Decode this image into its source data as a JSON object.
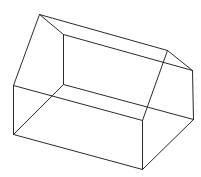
{
  "figure": {
    "stroke_color": "#2a2a2a",
    "background": "#ffffff",
    "vertices": {
      "A": [
        39,
        14
      ],
      "B": [
        63,
        34
      ],
      "C": [
        13,
        85
      ],
      "D": [
        13,
        134
      ],
      "E": [
        63,
        84
      ],
      "F": [
        142,
        120
      ],
      "G": [
        142,
        169
      ],
      "P": [
        167,
        50
      ],
      "Q": [
        192,
        70
      ],
      "R": [
        193,
        119
      ]
    },
    "edges": [
      [
        "A",
        "B"
      ],
      [
        "A",
        "C"
      ],
      [
        "A",
        "P"
      ],
      [
        "B",
        "Q"
      ],
      [
        "B",
        "E"
      ],
      [
        "C",
        "D"
      ],
      [
        "C",
        "F"
      ],
      [
        "D",
        "G"
      ],
      [
        "D",
        "E"
      ],
      [
        "E",
        "R"
      ],
      [
        "P",
        "Q"
      ],
      [
        "P",
        "F"
      ],
      [
        "Q",
        "R"
      ],
      [
        "F",
        "G"
      ],
      [
        "G",
        "R"
      ]
    ]
  }
}
